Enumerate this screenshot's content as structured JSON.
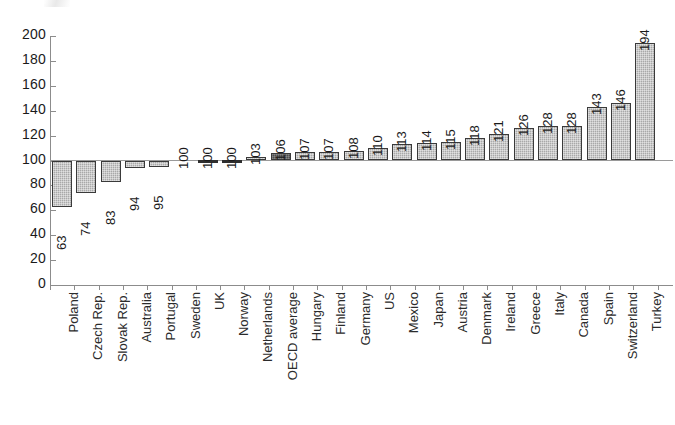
{
  "chart_data": {
    "type": "bar",
    "title": "",
    "subtitle": "",
    "xlabel": "",
    "ylabel": "",
    "ylim": [
      0,
      200
    ],
    "ytick_step": 20,
    "yticks": [
      200,
      180,
      160,
      140,
      120,
      100,
      80,
      60,
      40,
      20,
      0
    ],
    "grid": false,
    "legend": "none",
    "reference_line": 100,
    "reference_note": "bars are drawn relative to the 100 reference line; values below 100 extend downward, values above 100 extend upward",
    "highlight_category": "OECD average",
    "categories": [
      "Poland",
      "Czech Rep.",
      "Slovak Rep.",
      "Australia",
      "Portugal",
      "Sweden",
      "UK",
      "Norway",
      "Netherlands",
      "OECD average",
      "Hungary",
      "Finland",
      "Germany",
      "US",
      "Mexico",
      "Japan",
      "Austria",
      "Denmark",
      "Ireland",
      "Greece",
      "Italy",
      "Canada",
      "Spain",
      "Switzerland",
      "Turkey"
    ],
    "values": [
      63,
      74,
      83,
      94,
      95,
      100,
      100,
      100,
      103,
      106,
      107,
      107,
      108,
      110,
      113,
      114,
      115,
      118,
      121,
      126,
      128,
      128,
      143,
      146,
      194
    ],
    "value_labels": [
      "63",
      "74",
      "83",
      "94",
      "95",
      "100",
      "100",
      "100",
      "103",
      "106",
      "107",
      "107",
      "108",
      "110",
      "113",
      "114",
      "115",
      "118",
      "121",
      "126",
      "128",
      "128",
      "143",
      "146",
      "194"
    ]
  },
  "colors": {
    "bar_fill": "#a9a9a9",
    "bar_border": "#3a3a3a",
    "highlight_fill": "#4d4d4d",
    "axis": "#8c8c8c",
    "text": "#1a1a1a",
    "background": "#ffffff"
  }
}
